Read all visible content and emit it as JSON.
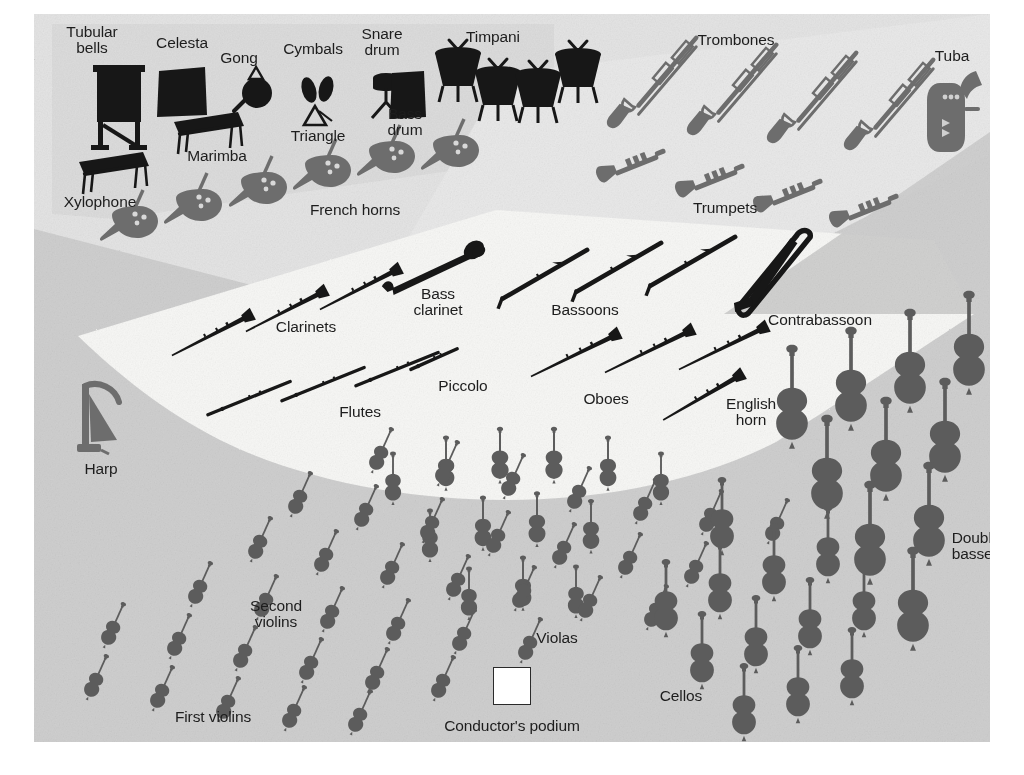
{
  "diagram": {
    "colors": {
      "page": "#ffffff",
      "string_floor": "#cfcfcf",
      "percussion_band": "#dcdcdc",
      "brass_band": "#e4e4e4",
      "woodwind_wedge": "#f7f7f5",
      "dark_instrument": "#171717",
      "gray_instrument": "#6d6d6d",
      "string_instrument": "#5c5c5c",
      "label_text": "#1d1d1d",
      "podium_fill": "#ffffff",
      "podium_border": "#2a2a2a"
    }
  },
  "podium": {
    "label": "Conductor's podium",
    "x": 478,
    "y": 672,
    "size": 36,
    "label_x": 478,
    "label_y": 712
  },
  "labels": [
    {
      "name": "tubular-bells",
      "text": "Tubular\nbells",
      "x": 58,
      "y": 26
    },
    {
      "name": "celesta",
      "text": "Celesta",
      "x": 148,
      "y": 29
    },
    {
      "name": "gong",
      "text": "Gong",
      "x": 205,
      "y": 44
    },
    {
      "name": "cymbals",
      "text": "Cymbals",
      "x": 279,
      "y": 35
    },
    {
      "name": "snare-drum",
      "text": "Snare\ndrum",
      "x": 348,
      "y": 28
    },
    {
      "name": "timpani",
      "text": "Timpani",
      "x": 459,
      "y": 23
    },
    {
      "name": "trombones",
      "text": "Trombones",
      "x": 702,
      "y": 26
    },
    {
      "name": "tuba",
      "text": "Tuba",
      "x": 918,
      "y": 42
    },
    {
      "name": "triangle",
      "text": "Triangle",
      "x": 284,
      "y": 122
    },
    {
      "name": "bass-drum",
      "text": "Bass\ndrum",
      "x": 371,
      "y": 108
    },
    {
      "name": "marimba",
      "text": "Marimba",
      "x": 183,
      "y": 142
    },
    {
      "name": "xylophone",
      "text": "Xylophone",
      "x": 66,
      "y": 188
    },
    {
      "name": "french-horns",
      "text": "French horns",
      "x": 321,
      "y": 196
    },
    {
      "name": "trumpets",
      "text": "Trumpets",
      "x": 691,
      "y": 194
    },
    {
      "name": "bass-clarinet",
      "text": "Bass\nclarinet",
      "x": 404,
      "y": 288
    },
    {
      "name": "bassoons",
      "text": "Bassoons",
      "x": 551,
      "y": 296
    },
    {
      "name": "contrabassoon",
      "text": "Contrabassoon",
      "x": 786,
      "y": 306
    },
    {
      "name": "clarinets",
      "text": "Clarinets",
      "x": 272,
      "y": 313
    },
    {
      "name": "piccolo",
      "text": "Piccolo",
      "x": 429,
      "y": 372
    },
    {
      "name": "oboes",
      "text": "Oboes",
      "x": 572,
      "y": 385
    },
    {
      "name": "flutes",
      "text": "Flutes",
      "x": 326,
      "y": 398
    },
    {
      "name": "english-horn",
      "text": "English\nhorn",
      "x": 717,
      "y": 398
    },
    {
      "name": "harp",
      "text": "Harp",
      "x": 67,
      "y": 455
    },
    {
      "name": "double-basses",
      "text": "Double\nbasses",
      "x": 942,
      "y": 532
    },
    {
      "name": "second-violins",
      "text": "Second\nviolins",
      "x": 242,
      "y": 600
    },
    {
      "name": "violas",
      "text": "Violas",
      "x": 523,
      "y": 624
    },
    {
      "name": "cellos",
      "text": "Cellos",
      "x": 647,
      "y": 682
    },
    {
      "name": "first-violins",
      "text": "First violins",
      "x": 179,
      "y": 703
    }
  ],
  "instruments": {
    "tubular_bells": [
      {
        "x": 85,
        "y": 92,
        "s": 1.0,
        "r": 0
      }
    ],
    "celesta": [
      {
        "x": 148,
        "y": 79,
        "s": 1.0,
        "r": 0
      }
    ],
    "xylophone": [
      {
        "x": 80,
        "y": 158,
        "s": 1.0,
        "r": 0
      }
    ],
    "marimba": [
      {
        "x": 175,
        "y": 118,
        "s": 1.0,
        "r": 0
      }
    ],
    "gong": [
      {
        "x": 221,
        "y": 75,
        "s": 1.0,
        "r": 0
      }
    ],
    "cymbals": [
      {
        "x": 284,
        "y": 76,
        "s": 1.0,
        "r": 0
      }
    ],
    "triangle": [
      {
        "x": 284,
        "y": 103,
        "s": 1.0,
        "r": 0
      }
    ],
    "snare_drum": [
      {
        "x": 352,
        "y": 80,
        "s": 1.0,
        "r": 0
      }
    ],
    "bass_drum": [
      {
        "x": 374,
        "y": 81,
        "s": 1.0,
        "r": 0
      }
    ],
    "timpani": [
      {
        "x": 424,
        "y": 57,
        "s": 1.0,
        "r": 0
      },
      {
        "x": 464,
        "y": 76,
        "s": 1.0,
        "r": 0
      },
      {
        "x": 504,
        "y": 78,
        "s": 1.0,
        "r": 0
      },
      {
        "x": 544,
        "y": 58,
        "s": 1.0,
        "r": 0
      }
    ],
    "trombones": [
      {
        "x": 612,
        "y": 73,
        "s": 1.0,
        "r": -27
      },
      {
        "x": 692,
        "y": 80,
        "s": 1.0,
        "r": -27
      },
      {
        "x": 772,
        "y": 88,
        "s": 1.0,
        "r": -27
      },
      {
        "x": 849,
        "y": 95,
        "s": 1.0,
        "r": -27
      }
    ],
    "tuba": [
      {
        "x": 921,
        "y": 96,
        "s": 1.0,
        "r": 0
      }
    ],
    "trumpets": [
      {
        "x": 600,
        "y": 155,
        "s": 1.0,
        "r": -22
      },
      {
        "x": 679,
        "y": 170,
        "s": 1.0,
        "r": -22
      },
      {
        "x": 757,
        "y": 185,
        "s": 1.0,
        "r": -22
      },
      {
        "x": 833,
        "y": 200,
        "s": 1.0,
        "r": -22
      }
    ],
    "french_horns": [
      {
        "x": 96,
        "y": 202,
        "s": 1.0,
        "r": 0
      },
      {
        "x": 160,
        "y": 185,
        "s": 1.0,
        "r": 0
      },
      {
        "x": 225,
        "y": 168,
        "s": 1.0,
        "r": 0
      },
      {
        "x": 289,
        "y": 151,
        "s": 1.0,
        "r": 0
      },
      {
        "x": 353,
        "y": 137,
        "s": 1.0,
        "r": 0
      },
      {
        "x": 417,
        "y": 131,
        "s": 1.0,
        "r": 0
      }
    ],
    "clarinets": [
      {
        "x": 178,
        "y": 321,
        "s": 1.0,
        "r": -27
      },
      {
        "x": 252,
        "y": 297,
        "s": 1.0,
        "r": -27
      },
      {
        "x": 326,
        "y": 275,
        "s": 1.0,
        "r": -27
      }
    ],
    "flutes": [
      {
        "x": 215,
        "y": 384,
        "s": 1.0,
        "r": -22
      },
      {
        "x": 289,
        "y": 370,
        "s": 1.0,
        "r": -22
      },
      {
        "x": 363,
        "y": 355,
        "s": 1.0,
        "r": -22
      }
    ],
    "piccolo": [
      {
        "x": 400,
        "y": 345,
        "s": 1.0,
        "r": -24
      }
    ],
    "bass_clarinet": [
      {
        "x": 404,
        "y": 250,
        "s": 1.0,
        "r": -38
      }
    ],
    "bassoons": [
      {
        "x": 509,
        "y": 261,
        "s": 1.0,
        "r": -30
      },
      {
        "x": 583,
        "y": 254,
        "s": 1.0,
        "r": -30
      },
      {
        "x": 657,
        "y": 248,
        "s": 1.0,
        "r": -30
      }
    ],
    "oboes": [
      {
        "x": 541,
        "y": 341,
        "s": 1.0,
        "r": -26
      },
      {
        "x": 615,
        "y": 337,
        "s": 1.0,
        "r": -26
      },
      {
        "x": 689,
        "y": 334,
        "s": 1.0,
        "r": -26
      }
    ],
    "english_horn": [
      {
        "x": 669,
        "y": 383,
        "s": 1.0,
        "r": -30
      }
    ],
    "contrabassoon": [
      {
        "x": 732,
        "y": 265,
        "s": 1.0,
        "r": -34
      }
    ],
    "harp": [
      {
        "x": 68,
        "y": 405,
        "s": 1.0,
        "r": 0
      }
    ],
    "violas": [
      {
        "x": 359,
        "y": 467,
        "s": 0.92,
        "r": 0
      },
      {
        "x": 412,
        "y": 452,
        "s": 0.95,
        "r": 0
      },
      {
        "x": 466,
        "y": 444,
        "s": 0.98,
        "r": 0
      },
      {
        "x": 520,
        "y": 444,
        "s": 0.98,
        "r": 0
      },
      {
        "x": 574,
        "y": 452,
        "s": 0.95,
        "r": 0
      },
      {
        "x": 627,
        "y": 467,
        "s": 0.92,
        "r": 0
      },
      {
        "x": 396,
        "y": 524,
        "s": 0.92,
        "r": 0
      },
      {
        "x": 449,
        "y": 512,
        "s": 0.95,
        "r": 0
      },
      {
        "x": 503,
        "y": 508,
        "s": 0.96,
        "r": 0
      },
      {
        "x": 557,
        "y": 515,
        "s": 0.94,
        "r": 0
      },
      {
        "x": 435,
        "y": 582,
        "s": 0.92,
        "r": 0
      },
      {
        "x": 489,
        "y": 572,
        "s": 0.95,
        "r": 0
      },
      {
        "x": 542,
        "y": 580,
        "s": 0.92,
        "r": 0
      }
    ],
    "first_violins": [
      {
        "x": 62,
        "y": 665,
        "s": 1.0,
        "r": 24
      },
      {
        "x": 128,
        "y": 676,
        "s": 1.0,
        "r": 24
      },
      {
        "x": 194,
        "y": 687,
        "s": 1.0,
        "r": 24
      },
      {
        "x": 260,
        "y": 696,
        "s": 1.0,
        "r": 24
      },
      {
        "x": 326,
        "y": 700,
        "s": 1.0,
        "r": 24
      },
      {
        "x": 79,
        "y": 613,
        "s": 1.0,
        "r": 24
      },
      {
        "x": 145,
        "y": 624,
        "s": 1.0,
        "r": 24
      },
      {
        "x": 211,
        "y": 636,
        "s": 1.0,
        "r": 24
      },
      {
        "x": 277,
        "y": 648,
        "s": 1.0,
        "r": 24
      },
      {
        "x": 343,
        "y": 658,
        "s": 1.0,
        "r": 24
      },
      {
        "x": 409,
        "y": 666,
        "s": 1.0,
        "r": 24
      },
      {
        "x": 166,
        "y": 572,
        "s": 1.0,
        "r": 24
      },
      {
        "x": 232,
        "y": 585,
        "s": 1.0,
        "r": 24
      },
      {
        "x": 298,
        "y": 597,
        "s": 1.0,
        "r": 24
      },
      {
        "x": 364,
        "y": 609,
        "s": 1.0,
        "r": 24
      },
      {
        "x": 430,
        "y": 619,
        "s": 1.0,
        "r": 24
      },
      {
        "x": 496,
        "y": 628,
        "s": 1.0,
        "r": 24
      }
    ],
    "second_violins": [
      {
        "x": 266,
        "y": 482,
        "s": 1.0,
        "r": 24
      },
      {
        "x": 332,
        "y": 495,
        "s": 1.0,
        "r": 24
      },
      {
        "x": 398,
        "y": 508,
        "s": 1.0,
        "r": 24
      },
      {
        "x": 464,
        "y": 521,
        "s": 1.0,
        "r": 24
      },
      {
        "x": 530,
        "y": 533,
        "s": 1.0,
        "r": 24
      },
      {
        "x": 596,
        "y": 543,
        "s": 1.0,
        "r": 24
      },
      {
        "x": 662,
        "y": 552,
        "s": 1.0,
        "r": 24
      },
      {
        "x": 347,
        "y": 438,
        "s": 1.0,
        "r": 24
      },
      {
        "x": 413,
        "y": 451,
        "s": 1.0,
        "r": 24
      },
      {
        "x": 479,
        "y": 464,
        "s": 1.0,
        "r": 24
      },
      {
        "x": 545,
        "y": 477,
        "s": 1.0,
        "r": 24
      },
      {
        "x": 611,
        "y": 489,
        "s": 1.0,
        "r": 24
      },
      {
        "x": 677,
        "y": 500,
        "s": 1.0,
        "r": 24
      },
      {
        "x": 743,
        "y": 509,
        "s": 1.0,
        "r": 24
      },
      {
        "x": 226,
        "y": 527,
        "s": 1.0,
        "r": 24
      },
      {
        "x": 292,
        "y": 540,
        "s": 1.0,
        "r": 24
      },
      {
        "x": 358,
        "y": 553,
        "s": 1.0,
        "r": 24
      },
      {
        "x": 424,
        "y": 565,
        "s": 1.0,
        "r": 24
      },
      {
        "x": 490,
        "y": 576,
        "s": 1.0,
        "r": 24
      },
      {
        "x": 556,
        "y": 586,
        "s": 1.0,
        "r": 24
      },
      {
        "x": 622,
        "y": 595,
        "s": 1.0,
        "r": 24
      }
    ],
    "cellos": [
      {
        "x": 668,
        "y": 640,
        "s": 1.0,
        "r": 0
      },
      {
        "x": 722,
        "y": 624,
        "s": 1.0,
        "r": 0
      },
      {
        "x": 776,
        "y": 606,
        "s": 1.0,
        "r": 0
      },
      {
        "x": 830,
        "y": 588,
        "s": 1.0,
        "r": 0
      },
      {
        "x": 710,
        "y": 692,
        "s": 1.0,
        "r": 0
      },
      {
        "x": 764,
        "y": 674,
        "s": 1.0,
        "r": 0
      },
      {
        "x": 818,
        "y": 656,
        "s": 1.0,
        "r": 0
      },
      {
        "x": 632,
        "y": 588,
        "s": 1.0,
        "r": 0
      },
      {
        "x": 686,
        "y": 570,
        "s": 1.0,
        "r": 0
      },
      {
        "x": 740,
        "y": 552,
        "s": 1.0,
        "r": 0
      },
      {
        "x": 794,
        "y": 534,
        "s": 1.0,
        "r": 0
      },
      {
        "x": 688,
        "y": 506,
        "s": 1.0,
        "r": 0
      }
    ],
    "double_basses": [
      {
        "x": 793,
        "y": 458,
        "s": 1.08,
        "r": 0
      },
      {
        "x": 852,
        "y": 440,
        "s": 1.08,
        "r": 0
      },
      {
        "x": 911,
        "y": 421,
        "s": 1.08,
        "r": 0
      },
      {
        "x": 836,
        "y": 524,
        "s": 1.08,
        "r": 0
      },
      {
        "x": 895,
        "y": 505,
        "s": 1.08,
        "r": 0
      },
      {
        "x": 879,
        "y": 590,
        "s": 1.08,
        "r": 0
      },
      {
        "x": 758,
        "y": 388,
        "s": 1.08,
        "r": 0
      },
      {
        "x": 817,
        "y": 370,
        "s": 1.08,
        "r": 0
      },
      {
        "x": 876,
        "y": 352,
        "s": 1.08,
        "r": 0
      },
      {
        "x": 935,
        "y": 334,
        "s": 1.08,
        "r": 0
      }
    ]
  }
}
